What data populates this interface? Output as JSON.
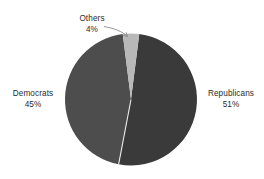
{
  "chart_data": {
    "type": "pie",
    "title": "",
    "subtitle": "",
    "xlabel": "",
    "ylabel": "",
    "grid": false,
    "legend": "none",
    "labels_position": "outside-with-leader-line",
    "units": "percent",
    "total": 100,
    "categories": [
      "Republicans",
      "Democrats",
      "Others"
    ],
    "values": [
      51,
      45,
      4
    ],
    "slices": [
      {
        "name": "Republicans",
        "value": 51,
        "value_label": "51%",
        "color": "#3a3a3a",
        "start_angle_deg": 7.2,
        "end_angle_deg": 190.8,
        "label_side": "right",
        "has_leader_line": false
      },
      {
        "name": "Democrats",
        "value": 45,
        "value_label": "45%",
        "color": "#4d4d4d",
        "start_angle_deg": 190.8,
        "end_angle_deg": 352.8,
        "label_side": "left",
        "has_leader_line": false
      },
      {
        "name": "Others",
        "value": 4,
        "value_label": "4%",
        "color": "#b8b8b8",
        "start_angle_deg": 352.8,
        "end_angle_deg": 7.2,
        "label_side": "top",
        "has_leader_line": true
      }
    ]
  },
  "labels": {
    "others": {
      "name": "Others",
      "value": "4%"
    },
    "democrats": {
      "name": "Democrats",
      "value": "45%"
    },
    "republicans": {
      "name": "Republicans",
      "value": "51%"
    }
  },
  "style": {
    "background": "#ffffff",
    "text_color": "#2b2b2b",
    "leader_line_color": "#7a7a7a",
    "slice_divider_color": "#ffffff"
  },
  "geometry": {
    "center_x": 131,
    "center_y": 99.5,
    "radius": 66
  }
}
